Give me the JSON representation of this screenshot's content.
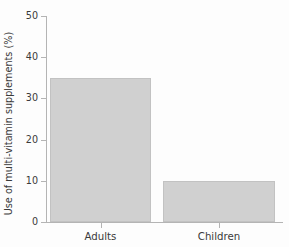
{
  "chart_data": {
    "type": "bar",
    "title": "",
    "subtitle": "",
    "xlabel": "",
    "ylabel": "Use of multi-vitamin supplements (%)",
    "categories": [
      "Adults",
      "Children"
    ],
    "values": [
      35,
      10
    ],
    "ylim": [
      0,
      50
    ],
    "yticks": [
      0,
      10,
      20,
      30,
      40,
      50
    ],
    "ytick_labels": [
      "0",
      "10",
      "20",
      "30",
      "40",
      "50"
    ],
    "grid": false,
    "legend": null,
    "annotations": [],
    "colors": {
      "bar_fill": "#d0d0d0",
      "bar_edge": "#c2c2c2",
      "axis": "#b4b4b4",
      "text": "#3a3a3a",
      "background": "#fdfdfd"
    }
  }
}
